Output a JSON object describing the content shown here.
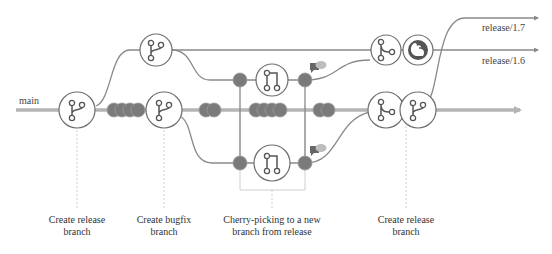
{
  "colors": {
    "main_line": "#b5b5b5",
    "branch_line": "#8a8a8a",
    "commit": "#7a7a7a",
    "commit_stroke": "#9a9a9a",
    "node_stroke": "#6e6e6e",
    "icon": "#555555",
    "guide": "#cfcfcf",
    "comment_dark": "#666666",
    "comment_light": "#bdbdbd"
  },
  "branches": {
    "main": "main",
    "release_17": "release/1.7",
    "release_16": "release/1.6"
  },
  "nodes": [
    {
      "id": "create-release-1",
      "icon": "git-branch-icon"
    },
    {
      "id": "create-bugfix",
      "icon": "git-branch-icon"
    },
    {
      "id": "release-branch-16",
      "icon": "git-branch-icon"
    },
    {
      "id": "pr-top",
      "icon": "git-pull-request-icon"
    },
    {
      "id": "pr-bottom",
      "icon": "git-pull-request-icon"
    },
    {
      "id": "merge-top",
      "icon": "git-merge-icon"
    },
    {
      "id": "squirrel",
      "icon": "squirrel-icon"
    },
    {
      "id": "merge-main",
      "icon": "git-merge-icon"
    },
    {
      "id": "create-release-2",
      "icon": "git-branch-icon"
    }
  ],
  "captions": {
    "create_release_1": [
      "Create release",
      "branch"
    ],
    "create_bugfix": [
      "Create bugfix",
      "branch"
    ],
    "cherry_pick": [
      "Cherry-picking to a new",
      "branch from release"
    ],
    "create_release_2": [
      "Create release",
      "branch"
    ]
  }
}
